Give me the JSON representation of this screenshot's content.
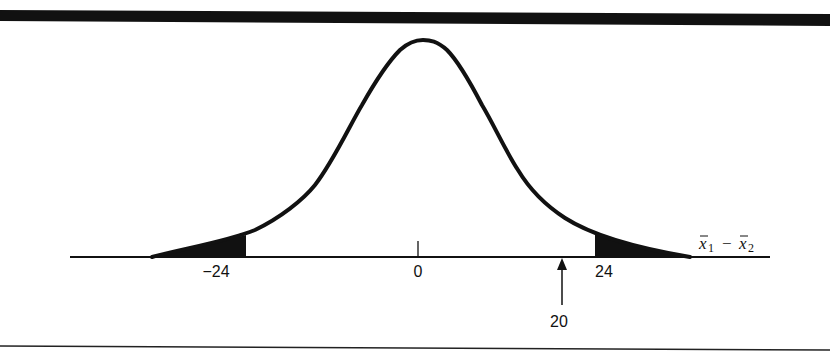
{
  "diagram": {
    "type": "normal-distribution-two-tailed",
    "axis_variable": {
      "first": "x",
      "first_sub": "1",
      "operator": "−",
      "second": "x",
      "second_sub": "2"
    },
    "ticks": [
      {
        "label": "−24",
        "value": -24
      },
      {
        "label": "0",
        "value": 0
      },
      {
        "label": "24",
        "value": 24
      }
    ],
    "marker": {
      "label": "20",
      "value": 20
    },
    "shaded_regions": [
      "x̄1 − x̄2 ≤ −24",
      "x̄1 − x̄2 ≥ 24"
    ],
    "colors": {
      "ink": "#111111",
      "background": "#ffffff"
    }
  }
}
